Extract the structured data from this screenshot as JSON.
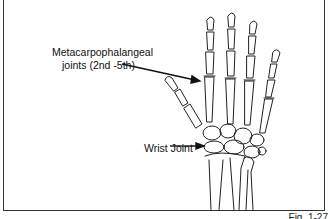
{
  "figure": {
    "caption": "Fig. 1-27",
    "labels": {
      "mcp_line1": "Metacarpophalangeal",
      "mcp_line2": "joints (2nd -5th)",
      "wrist": "Wrist Joint"
    },
    "colors": {
      "line": "#222222",
      "frame": "#333333",
      "background": "#ffffff"
    }
  }
}
